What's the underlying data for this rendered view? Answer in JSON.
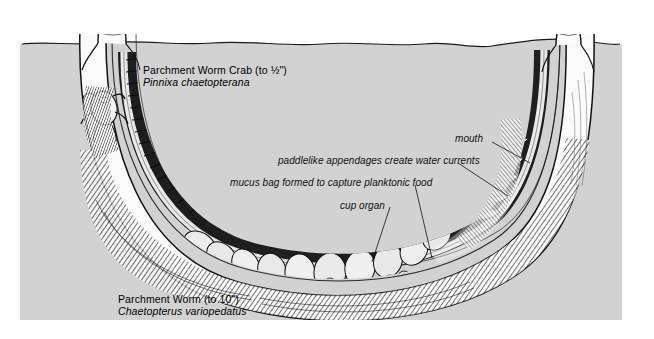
{
  "figure": {
    "title_alt": "Parchment worm in U-shaped tube, cutaway view",
    "colors": {
      "sediment": "#d2d2d2",
      "water": "#ffffff",
      "ink": "#101010",
      "tube_fill": "#fbfbfb",
      "page": "#ffffff"
    }
  },
  "species": [
    {
      "common": "Parchment Worm Crab (to ½\")",
      "scientific": "Pinnixa chaetopterana",
      "x": 143,
      "y": 64
    },
    {
      "common": "Parchment Worm (to 10\")",
      "scientific": "Chaetopterus variopedatus",
      "x": 118,
      "y": 293
    }
  ],
  "callouts": [
    {
      "text": "mouth",
      "x": 455,
      "y": 133,
      "leader": {
        "x1": 492,
        "y1": 142,
        "x2": 530,
        "y2": 163
      }
    },
    {
      "text": "paddlelike appendages create water currents",
      "x": 278,
      "y": 155,
      "leader": {
        "x1": 458,
        "y1": 163,
        "x2": 508,
        "y2": 196
      }
    },
    {
      "text": "mucus bag formed to capture planktonic food",
      "x": 230,
      "y": 177,
      "leader": {
        "x1": 415,
        "y1": 185,
        "x2": 432,
        "y2": 258
      }
    },
    {
      "text": "cup organ",
      "x": 340,
      "y": 200,
      "leader": {
        "x1": 390,
        "y1": 207,
        "x2": 372,
        "y2": 262
      }
    }
  ],
  "scene": {
    "sediment_panel": {
      "x": 20,
      "y": 34,
      "width": 602,
      "height": 286
    },
    "water_line_label": "seafloor surface",
    "left_chimney": {
      "x": 98,
      "y": 22,
      "label": "left-tube-opening"
    },
    "right_chimney": {
      "x": 556,
      "y": 30,
      "label": "right-tube-opening"
    },
    "tube_shape": "U-shaped parchment tube"
  }
}
